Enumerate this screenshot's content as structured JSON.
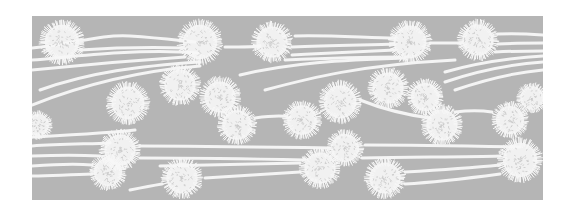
{
  "artwork": {
    "description": "Decorative gray panel with white spiky dandelion-like puffs and flowing white lines",
    "panel": {
      "x": 32,
      "y": 16,
      "width": 511,
      "height": 184,
      "color": "#b5b5b5"
    },
    "background": "#ffffff",
    "line_color": "#f4f4f4",
    "puff_color": "#f7f7f7",
    "puffs": [
      {
        "cx": 62,
        "cy": 42,
        "r": 22
      },
      {
        "cx": 200,
        "cy": 42,
        "r": 22
      },
      {
        "cx": 272,
        "cy": 42,
        "r": 20
      },
      {
        "cx": 410,
        "cy": 42,
        "r": 21
      },
      {
        "cx": 478,
        "cy": 40,
        "r": 20
      },
      {
        "cx": 180,
        "cy": 85,
        "r": 20
      },
      {
        "cx": 128,
        "cy": 103,
        "r": 21
      },
      {
        "cx": 220,
        "cy": 97,
        "r": 20
      },
      {
        "cx": 237,
        "cy": 125,
        "r": 19
      },
      {
        "cx": 302,
        "cy": 120,
        "r": 19
      },
      {
        "cx": 340,
        "cy": 102,
        "r": 21
      },
      {
        "cx": 388,
        "cy": 88,
        "r": 20
      },
      {
        "cx": 425,
        "cy": 97,
        "r": 18
      },
      {
        "cx": 442,
        "cy": 125,
        "r": 20
      },
      {
        "cx": 510,
        "cy": 120,
        "r": 18
      },
      {
        "cx": 532,
        "cy": 98,
        "r": 15
      },
      {
        "cx": 38,
        "cy": 125,
        "r": 14
      },
      {
        "cx": 120,
        "cy": 150,
        "r": 20
      },
      {
        "cx": 108,
        "cy": 172,
        "r": 18
      },
      {
        "cx": 182,
        "cy": 178,
        "r": 20
      },
      {
        "cx": 320,
        "cy": 168,
        "r": 20
      },
      {
        "cx": 345,
        "cy": 148,
        "r": 18
      },
      {
        "cx": 385,
        "cy": 178,
        "r": 20
      },
      {
        "cx": 520,
        "cy": 160,
        "r": 22
      }
    ],
    "lines": [
      {
        "d": "M32 48 C 70 45, 100 34, 130 36 C 160 38, 175 40, 195 42",
        "w": 3
      },
      {
        "d": "M32 60 C 80 56, 130 50, 180 52 L 198 53",
        "w": 3
      },
      {
        "d": "M80 50 C 110 48, 150 47, 185 48",
        "w": 3
      },
      {
        "d": "M32 70 C 90 64, 140 60, 185 57",
        "w": 3
      },
      {
        "d": "M40 90 C 90 72, 140 66, 200 62",
        "w": 3
      },
      {
        "d": "M32 105 C 90 82, 150 70, 200 66",
        "w": 3
      },
      {
        "d": "M225 47 C 245 47, 255 47, 260 46",
        "w": 3
      },
      {
        "d": "M292 47 C 330 45, 370 45, 395 44",
        "w": 3
      },
      {
        "d": "M295 36 C 330 35, 370 38, 395 38",
        "w": 3
      },
      {
        "d": "M292 55 C 330 53, 370 51, 395 50",
        "w": 3
      },
      {
        "d": "M285 60 C 330 58, 370 57, 400 57",
        "w": 3
      },
      {
        "d": "M430 43 L 462 43",
        "w": 3
      },
      {
        "d": "M498 34 C 515 33, 530 34, 543 35",
        "w": 3
      },
      {
        "d": "M498 44 C 515 43, 530 43, 543 43",
        "w": 3
      },
      {
        "d": "M495 52 C 515 51, 530 51, 543 51",
        "w": 3
      },
      {
        "d": "M240 75 C 290 63, 340 60, 405 58",
        "w": 3
      },
      {
        "d": "M265 90 C 310 78, 360 65, 455 60",
        "w": 3
      },
      {
        "d": "M445 72 C 480 62, 510 58, 543 56",
        "w": 3
      },
      {
        "d": "M445 82 C 480 70, 515 64, 543 62",
        "w": 3
      },
      {
        "d": "M455 90 C 490 78, 520 72, 543 70",
        "w": 3
      },
      {
        "d": "M360 100 C 380 108, 400 114, 430 118",
        "w": 3
      },
      {
        "d": "M255 118 C 270 116, 285 116, 290 117",
        "w": 3
      },
      {
        "d": "M32 137 C 70 135, 110 133, 135 130",
        "w": 3
      },
      {
        "d": "M32 146 C 60 144, 90 144, 110 143",
        "w": 3
      },
      {
        "d": "M32 156 C 60 155, 80 155, 100 156",
        "w": 3
      },
      {
        "d": "M32 166 C 60 164, 80 164, 92 165",
        "w": 3
      },
      {
        "d": "M32 176 C 60 175, 75 175, 92 174",
        "w": 3
      },
      {
        "d": "M140 146 C 200 146, 260 147, 330 148",
        "w": 3
      },
      {
        "d": "M140 158 C 200 158, 260 159, 305 160",
        "w": 3
      },
      {
        "d": "M160 166 C 200 165, 250 164, 300 163",
        "w": 3
      },
      {
        "d": "M205 178 C 240 176, 270 174, 300 172",
        "w": 3
      },
      {
        "d": "M130 190 C 140 188, 150 186, 162 184",
        "w": 3
      },
      {
        "d": "M365 145 C 420 145, 470 146, 520 147",
        "w": 3
      },
      {
        "d": "M362 158 C 420 157, 470 157, 500 156",
        "w": 3
      },
      {
        "d": "M405 172 C 440 170, 470 168, 500 165",
        "w": 3
      },
      {
        "d": "M405 184 C 440 182, 470 178, 500 174",
        "w": 3
      },
      {
        "d": "M455 112 C 470 110, 480 110, 492 112",
        "w": 3
      }
    ]
  }
}
